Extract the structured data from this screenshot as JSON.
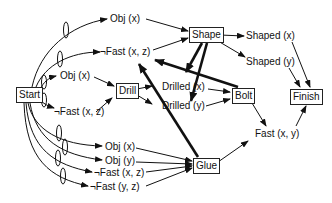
{
  "diagram": {
    "nodes": {
      "start": "Start",
      "drill": "Drill",
      "shape": "Shape",
      "bolt": "Bolt",
      "glue": "Glue",
      "finish": "Finish"
    },
    "conditions": {
      "obj_x_top": "Obj (x)",
      "not_fast_xz_top": "¬Fast (x, z)",
      "obj_x_mid": "Obj (x)",
      "not_fast_xz_mid": "¬Fast (x, z)",
      "drilled_x": "Drilled (x)",
      "drilled_y": "Drilled (y)",
      "shaped_x": "Shaped (x)",
      "shaped_y": "Shaped (y)",
      "fast_xy": "Fast (x, y)",
      "obj_x_low": "Obj (x)",
      "obj_y_low": "Obj (y)",
      "not_fast_xz_low": "¬Fast (x, z)",
      "not_fast_yz_low": "¬Fast (y, z)"
    },
    "colors": {
      "line": "#111111",
      "box_border": "#222222"
    }
  }
}
